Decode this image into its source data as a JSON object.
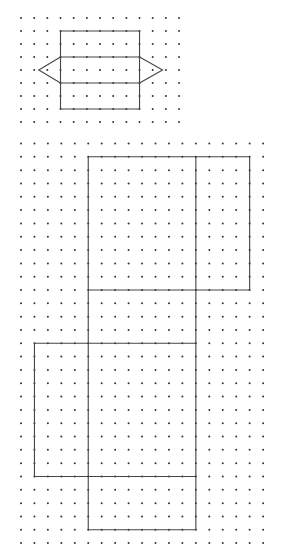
{
  "watermark": "",
  "colors": {
    "background": "#ffffff",
    "dot": "#333333",
    "line": "#444444"
  },
  "figures": [
    {
      "name": "prism-net-small",
      "grid": {
        "cols": 13,
        "rows": 9,
        "x0": 21,
        "y0": 18,
        "dx": 13.17,
        "dy": 13.0
      },
      "polylines": [
        [
          [
            3,
            1
          ],
          [
            9,
            1
          ],
          [
            9,
            7
          ],
          [
            3,
            7
          ],
          [
            3,
            1
          ]
        ],
        [
          [
            3,
            3
          ],
          [
            9,
            3
          ]
        ],
        [
          [
            3,
            5
          ],
          [
            9,
            5
          ]
        ],
        [
          [
            3,
            3
          ],
          [
            1.35,
            4
          ],
          [
            3,
            5
          ]
        ],
        [
          [
            9,
            3
          ],
          [
            10.75,
            4
          ],
          [
            9,
            5
          ]
        ]
      ]
    },
    {
      "name": "box-net-large",
      "grid": {
        "cols": 19,
        "rows": 31,
        "x0": 21,
        "y0": 143.5,
        "dx": 13.45,
        "dy": 13.32
      },
      "polylines": [
        [
          [
            5,
            1
          ],
          [
            17,
            1
          ],
          [
            17,
            11
          ],
          [
            5,
            11
          ],
          [
            5,
            1
          ]
        ],
        [
          [
            13,
            1
          ],
          [
            13,
            29
          ]
        ],
        [
          [
            5,
            11
          ],
          [
            5,
            29
          ],
          [
            13,
            29
          ]
        ],
        [
          [
            1,
            15
          ],
          [
            13,
            15
          ]
        ],
        [
          [
            1,
            15
          ],
          [
            1,
            25
          ],
          [
            13,
            25
          ]
        ]
      ]
    }
  ]
}
